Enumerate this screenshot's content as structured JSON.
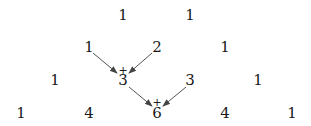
{
  "diagram": {
    "title": "",
    "rows": [
      {
        "values": [
          "1",
          "1"
        ],
        "x": [
          123,
          190
        ],
        "y": 15
      },
      {
        "values": [
          "1",
          "2",
          "1"
        ],
        "x": [
          89,
          157,
          225
        ],
        "y": 47
      },
      {
        "values": [
          "1",
          "3",
          "3",
          "1"
        ],
        "x": [
          55,
          123,
          190,
          258
        ],
        "y": 80
      },
      {
        "values": [
          "1",
          "4",
          "6",
          "4",
          "1"
        ],
        "x": [
          21,
          89,
          157,
          225,
          292
        ],
        "y": 113
      }
    ],
    "plus_signs": [
      {
        "label": "+",
        "x": 123,
        "y": 70
      },
      {
        "label": "+",
        "x": 157,
        "y": 102
      }
    ],
    "arrows": [
      {
        "from": "row1-1",
        "to": "row2-3",
        "x1": 93,
        "y1": 53,
        "x2": 117,
        "y2": 73
      },
      {
        "from": "row1-2",
        "to": "row2-3",
        "x1": 152,
        "y1": 53,
        "x2": 129,
        "y2": 73
      },
      {
        "from": "row2-3",
        "to": "row3-6",
        "x1": 129,
        "y1": 87,
        "x2": 152,
        "y2": 106
      },
      {
        "from": "row2-3b",
        "to": "row3-6",
        "x1": 186,
        "y1": 87,
        "x2": 163,
        "y2": 106
      }
    ],
    "colors": {
      "text": "#1a1a1a",
      "arrow": "#555555"
    }
  }
}
